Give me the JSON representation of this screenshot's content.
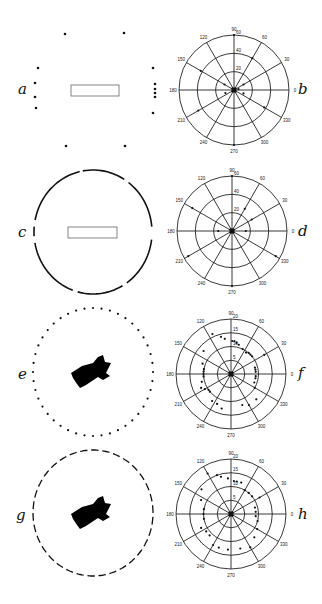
{
  "figure": {
    "panels": [
      {
        "id": "a",
        "label": "a",
        "kind": "illustration",
        "variant": "dots-rect"
      },
      {
        "id": "b",
        "label": "b",
        "kind": "polar"
      },
      {
        "id": "c",
        "label": "c",
        "kind": "illustration",
        "variant": "arcs-rect"
      },
      {
        "id": "d",
        "label": "d",
        "kind": "polar"
      },
      {
        "id": "e",
        "label": "e",
        "kind": "illustration",
        "variant": "dots-animal"
      },
      {
        "id": "f",
        "label": "f",
        "kind": "polar"
      },
      {
        "id": "g",
        "label": "g",
        "kind": "illustration",
        "variant": "dashes-animal"
      },
      {
        "id": "h",
        "label": "h",
        "kind": "polar"
      }
    ]
  },
  "chart_data": [
    {
      "panel": "b",
      "type": "scatter",
      "projection": "polar",
      "angle_ticks": [
        "0",
        "30",
        "60",
        "90",
        "120",
        "150",
        "180",
        "210",
        "240",
        "270",
        "300",
        "330"
      ],
      "radial_ticks": [
        "20",
        "40",
        "60"
      ],
      "rmax": 60,
      "points": [
        [
          90,
          60
        ],
        [
          270,
          60
        ],
        [
          150,
          42
        ],
        [
          60,
          40
        ],
        [
          210,
          45
        ],
        [
          330,
          38
        ],
        [
          150,
          12
        ],
        [
          200,
          10
        ],
        [
          30,
          12
        ],
        [
          340,
          11
        ],
        [
          10,
          5
        ],
        [
          0,
          0
        ]
      ]
    },
    {
      "panel": "d",
      "type": "scatter",
      "projection": "polar",
      "angle_ticks": [
        "0",
        "30",
        "60",
        "90",
        "120",
        "150",
        "180",
        "210",
        "240",
        "270",
        "300",
        "330"
      ],
      "radial_ticks": [
        "20",
        "40",
        "60"
      ],
      "rmax": 60,
      "points": [
        [
          90,
          60
        ],
        [
          270,
          60
        ],
        [
          150,
          50
        ],
        [
          60,
          28
        ],
        [
          30,
          25
        ],
        [
          180,
          15
        ],
        [
          0,
          15
        ],
        [
          210,
          55
        ],
        [
          330,
          55
        ],
        [
          0,
          0
        ]
      ]
    },
    {
      "panel": "f",
      "type": "scatter",
      "projection": "polar",
      "angle_ticks": [
        "0",
        "30",
        "60",
        "90",
        "120",
        "150",
        "180",
        "210",
        "240",
        "270",
        "300",
        "330"
      ],
      "radial_ticks": [
        "5",
        "10",
        "15",
        "20"
      ],
      "rmax": 20,
      "points": [
        [
          115,
          16
        ],
        [
          105,
          14
        ],
        [
          100,
          13
        ],
        [
          88,
          12
        ],
        [
          84,
          12
        ],
        [
          80,
          11.5
        ],
        [
          75,
          11
        ],
        [
          65,
          10
        ],
        [
          55,
          9.5
        ],
        [
          50,
          10
        ],
        [
          45,
          10
        ],
        [
          40,
          10
        ],
        [
          30,
          14
        ],
        [
          140,
          13
        ],
        [
          160,
          11
        ],
        [
          170,
          10
        ],
        [
          175,
          10
        ],
        [
          180,
          10
        ],
        [
          185,
          10
        ],
        [
          195,
          11
        ],
        [
          205,
          12
        ],
        [
          210,
          11
        ],
        [
          215,
          10
        ],
        [
          220,
          10
        ],
        [
          235,
          12
        ],
        [
          245,
          12
        ],
        [
          255,
          13
        ],
        [
          290,
          12
        ],
        [
          300,
          13
        ],
        [
          315,
          13
        ],
        [
          330,
          10
        ],
        [
          340,
          9
        ],
        [
          350,
          9
        ],
        [
          355,
          9
        ],
        [
          5,
          9
        ],
        [
          10,
          9
        ],
        [
          15,
          9
        ],
        [
          0,
          0
        ]
      ]
    },
    {
      "panel": "h",
      "type": "scatter",
      "projection": "polar",
      "angle_ticks": [
        "0",
        "30",
        "60",
        "90",
        "120",
        "150",
        "180",
        "210",
        "240",
        "270",
        "300",
        "330"
      ],
      "radial_ticks": [
        "5",
        "10",
        "15",
        "20"
      ],
      "rmax": 20,
      "points": [
        [
          120,
          17
        ],
        [
          110,
          15
        ],
        [
          105,
          14
        ],
        [
          95,
          13
        ],
        [
          85,
          12
        ],
        [
          80,
          12
        ],
        [
          72,
          12
        ],
        [
          60,
          10
        ],
        [
          50,
          10
        ],
        [
          40,
          10
        ],
        [
          30,
          12
        ],
        [
          140,
          14
        ],
        [
          155,
          12
        ],
        [
          170,
          10
        ],
        [
          180,
          10
        ],
        [
          190,
          10
        ],
        [
          205,
          12
        ],
        [
          215,
          11
        ],
        [
          225,
          11
        ],
        [
          240,
          13
        ],
        [
          250,
          13
        ],
        [
          265,
          13
        ],
        [
          285,
          13
        ],
        [
          300,
          14
        ],
        [
          315,
          12
        ],
        [
          330,
          11
        ],
        [
          345,
          10
        ],
        [
          355,
          9
        ],
        [
          5,
          9
        ],
        [
          15,
          9
        ],
        [
          0,
          0
        ]
      ]
    }
  ]
}
